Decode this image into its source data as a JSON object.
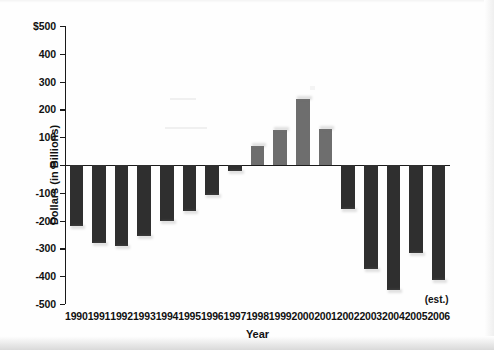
{
  "chart_data": {
    "type": "bar",
    "title": "",
    "xlabel": "Year",
    "ylabel": "Dollars (in Billions)",
    "ylim": [
      -500,
      500
    ],
    "ytick_labels": [
      "$500",
      "400",
      "300",
      "200",
      "100",
      "0",
      "-100",
      "-200",
      "-300",
      "-400",
      "-500"
    ],
    "ytick_values": [
      500,
      400,
      300,
      200,
      100,
      0,
      -100,
      -200,
      -300,
      -400,
      -500
    ],
    "grid": false,
    "legend": null,
    "categories": [
      "1990",
      "1991",
      "1992",
      "1993",
      "1994",
      "1995",
      "1996",
      "1997",
      "1998",
      "1999",
      "2000",
      "2001",
      "2002",
      "2003",
      "2004",
      "2005",
      "2006"
    ],
    "values": [
      -221,
      -279,
      -290,
      -255,
      -203,
      -164,
      -107,
      -22,
      70,
      125,
      236,
      128,
      -158,
      -375,
      -450,
      -318,
      -412
    ],
    "bar_colors": [
      "#2f2f2f",
      "#2f2f2f",
      "#2f2f2f",
      "#2f2f2f",
      "#2f2f2f",
      "#2f2f2f",
      "#2f2f2f",
      "#2f2f2f",
      "#6e6e6e",
      "#6e6e6e",
      "#6e6e6e",
      "#6e6e6e",
      "#2f2f2f",
      "#2f2f2f",
      "#2f2f2f",
      "#2f2f2f",
      "#2f2f2f"
    ],
    "annotations": [
      {
        "text": "(est.)",
        "near_category": "2006"
      }
    ],
    "colors": {
      "negative_bar": "#2f2f2f",
      "positive_bar": "#6e6e6e",
      "axis": "#1a1a1a",
      "background": "#ffffff"
    }
  }
}
